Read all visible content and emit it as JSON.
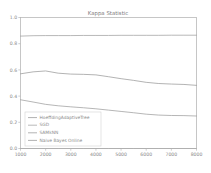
{
  "chart_data": {
    "type": "line",
    "title": "Kappa Statistic",
    "xlabel": "",
    "ylabel": "",
    "xlim": [
      1000,
      8000
    ],
    "ylim": [
      0.0,
      1.0
    ],
    "grid": false,
    "legend_position": "lower left",
    "x_ticks": [
      "1000",
      "2000",
      "3000",
      "4000",
      "5000",
      "6000",
      "7000",
      "8000"
    ],
    "x_tick_values": [
      1000,
      2000,
      3000,
      4000,
      5000,
      6000,
      7000,
      8000
    ],
    "y_ticks": [
      "0.0",
      "0.2",
      "0.4",
      "0.6",
      "0.8",
      "1.0"
    ],
    "y_tick_values": [
      0.0,
      0.2,
      0.4,
      0.6,
      0.8,
      1.0
    ],
    "x": [
      1000,
      1500,
      2000,
      2500,
      3000,
      3500,
      4000,
      4500,
      5000,
      5500,
      6000,
      6500,
      7000,
      7500,
      8000
    ],
    "series": [
      {
        "name": "HoeffdingAdaptiveTree",
        "color": "#9a9a9a",
        "values": [
          0.57,
          0.585,
          0.592,
          0.575,
          0.568,
          0.566,
          0.562,
          0.548,
          0.533,
          0.52,
          0.505,
          0.496,
          0.492,
          0.489,
          0.482
        ]
      },
      {
        "name": "SGD",
        "color": "#a8a8a8",
        "values": [
          0.0,
          0.0,
          0.0,
          0.0,
          0.0,
          0.0,
          0.0,
          0.0,
          0.0,
          0.0,
          0.0,
          0.0,
          0.0,
          0.0,
          0.0
        ]
      },
      {
        "name": "SAMkNN",
        "color": "#a0a0a0",
        "values": [
          0.858,
          0.861,
          0.862,
          0.862,
          0.862,
          0.863,
          0.863,
          0.863,
          0.864,
          0.864,
          0.864,
          0.864,
          0.865,
          0.865,
          0.865
        ]
      },
      {
        "name": "Naive Bayes Online",
        "color": "#9e9e9e",
        "values": [
          0.372,
          0.355,
          0.337,
          0.326,
          0.318,
          0.311,
          0.303,
          0.293,
          0.283,
          0.273,
          0.262,
          0.255,
          0.252,
          0.251,
          0.248
        ]
      }
    ]
  }
}
